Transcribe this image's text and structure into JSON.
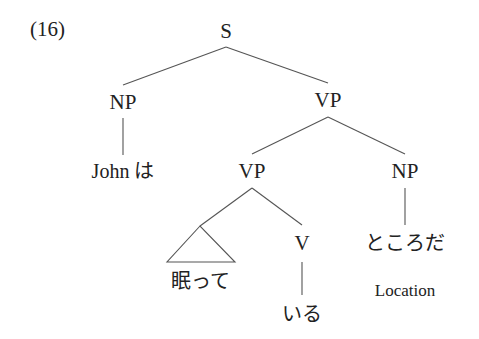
{
  "example_number": "(16)",
  "tree": {
    "root": "S",
    "nodes": {
      "s": "S",
      "np_subject": "NP",
      "vp_top": "VP",
      "vp_inner": "VP",
      "np_object": "NP",
      "v": "V"
    },
    "words": {
      "john_wa": "John は",
      "nemutte": "眠って",
      "iru": "いる",
      "tokoroda": "ところだ"
    },
    "glosses": {
      "location": "Location"
    },
    "structure": "[S [NP John は] [VP [VP [△ 眠って] [V いる]] [NP ところだ]]]"
  }
}
